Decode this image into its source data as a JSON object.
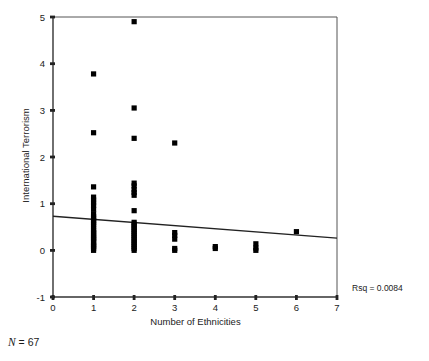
{
  "figure": {
    "n_prefix": "N",
    "n_eq": " = ",
    "n_value": "67",
    "rsq_label": "Rsq = 0.0084",
    "marker_color": "#000000",
    "axis_color": "#333333",
    "line_color": "#222222",
    "background": "#ffffff"
  },
  "chart_data": {
    "type": "scatter",
    "title": "",
    "xlabel": "Number of Ethnicities",
    "ylabel": "International Terrorism",
    "xlim": [
      0,
      7
    ],
    "ylim": [
      -1,
      5
    ],
    "xticks": [
      0,
      1,
      2,
      3,
      4,
      5,
      6,
      7
    ],
    "xtick_labels": [
      "0",
      "1",
      "2",
      "3",
      "4",
      "5",
      "6",
      "7"
    ],
    "yticks": [
      -1,
      0,
      1,
      2,
      3,
      4,
      5
    ],
    "ytick_labels": [
      "-1",
      "0",
      "1",
      "2",
      "3",
      "4",
      "5"
    ],
    "grid": false,
    "legend": null,
    "n": 67,
    "rsq": 0.0084,
    "annotations": [
      {
        "text": "Rsq = 0.0084",
        "x": 7.6,
        "y": -0.65
      },
      {
        "text": "N = 67",
        "x": -1.1,
        "y": -1.75
      }
    ],
    "fit_line": {
      "type": "linear",
      "x": [
        0,
        7
      ],
      "y": [
        0.73,
        0.26
      ],
      "intercept": 0.73,
      "slope": -0.067
    },
    "points": [
      {
        "x": 2,
        "y": 4.9
      },
      {
        "x": 1,
        "y": 3.78
      },
      {
        "x": 2,
        "y": 3.05
      },
      {
        "x": 1,
        "y": 2.52
      },
      {
        "x": 2,
        "y": 2.4
      },
      {
        "x": 3,
        "y": 2.3
      },
      {
        "x": 2,
        "y": 1.44
      },
      {
        "x": 2,
        "y": 1.38
      },
      {
        "x": 1,
        "y": 1.36
      },
      {
        "x": 2,
        "y": 1.24
      },
      {
        "x": 2,
        "y": 1.18
      },
      {
        "x": 1,
        "y": 1.14
      },
      {
        "x": 1,
        "y": 1.02
      },
      {
        "x": 1,
        "y": 0.96
      },
      {
        "x": 2,
        "y": 0.85
      },
      {
        "x": 1,
        "y": 0.78
      },
      {
        "x": 1,
        "y": 0.72
      },
      {
        "x": 1,
        "y": 0.68
      },
      {
        "x": 1,
        "y": 0.64
      },
      {
        "x": 1,
        "y": 0.6
      },
      {
        "x": 1,
        "y": 0.56
      },
      {
        "x": 1,
        "y": 0.52
      },
      {
        "x": 1,
        "y": 0.42
      },
      {
        "x": 6,
        "y": 0.4
      },
      {
        "x": 3,
        "y": 0.38
      },
      {
        "x": 3,
        "y": 0.32
      },
      {
        "x": 2,
        "y": 0.44
      },
      {
        "x": 2,
        "y": 0.4
      },
      {
        "x": 2,
        "y": 0.36
      },
      {
        "x": 2,
        "y": 0.32
      },
      {
        "x": 1,
        "y": 0.36
      },
      {
        "x": 1,
        "y": 0.32
      },
      {
        "x": 3,
        "y": 0.24
      },
      {
        "x": 2,
        "y": 0.28
      },
      {
        "x": 2,
        "y": 0.24
      },
      {
        "x": 1,
        "y": 0.28
      },
      {
        "x": 1,
        "y": 0.24
      },
      {
        "x": 2,
        "y": 0.2
      },
      {
        "x": 2,
        "y": 0.16
      },
      {
        "x": 1,
        "y": 0.2
      },
      {
        "x": 1,
        "y": 0.16
      },
      {
        "x": 5,
        "y": 0.14
      },
      {
        "x": 2,
        "y": 0.12
      },
      {
        "x": 2,
        "y": 0.08
      },
      {
        "x": 1,
        "y": 0.12
      },
      {
        "x": 1,
        "y": 0.08
      },
      {
        "x": 4,
        "y": 0.08
      },
      {
        "x": 5,
        "y": 0.05
      },
      {
        "x": 3,
        "y": 0.04
      },
      {
        "x": 2,
        "y": 0.04
      },
      {
        "x": 2,
        "y": 0.0
      },
      {
        "x": 1,
        "y": 0.04
      },
      {
        "x": 1,
        "y": 0.0
      },
      {
        "x": 4,
        "y": 0.04
      },
      {
        "x": 5,
        "y": 0.0
      },
      {
        "x": 3,
        "y": 0.0
      },
      {
        "x": 1,
        "y": 0.46
      },
      {
        "x": 2,
        "y": 0.48
      },
      {
        "x": 1,
        "y": 0.88
      },
      {
        "x": 2,
        "y": 1.3
      },
      {
        "x": 1,
        "y": 1.08
      },
      {
        "x": 1,
        "y": 0.38
      },
      {
        "x": 2,
        "y": 0.52
      },
      {
        "x": 2,
        "y": 0.56
      },
      {
        "x": 1,
        "y": 0.26
      },
      {
        "x": 2,
        "y": 0.6
      },
      {
        "x": 1,
        "y": 0.1
      }
    ]
  }
}
